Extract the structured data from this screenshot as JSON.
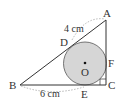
{
  "figure": {
    "points": {
      "A": {
        "label": "A",
        "x": 106,
        "y": 20
      },
      "B": {
        "label": "B",
        "x": 20,
        "y": 85
      },
      "C": {
        "label": "C",
        "x": 106,
        "y": 85
      },
      "D": {
        "label": "D",
        "x": 73,
        "y": 45
      },
      "E": {
        "label": "E",
        "x": 85,
        "y": 85
      },
      "F": {
        "label": "F",
        "x": 106,
        "y": 63
      },
      "O": {
        "label": "O",
        "x": 85,
        "y": 63
      }
    },
    "circle": {
      "cx": 85,
      "cy": 63,
      "r": 21.5,
      "fill": "#d6d6d6"
    },
    "measurements": {
      "AD": "4 cm",
      "BE": "6 cm"
    },
    "colors": {
      "line": "#333333",
      "circle_fill": "#d6d6d6",
      "dashed": "#999999"
    }
  }
}
